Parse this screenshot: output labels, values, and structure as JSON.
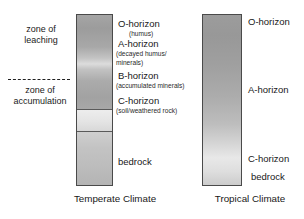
{
  "diagram": {
    "title_hidden": "Soil horizon profiles",
    "zones": [
      {
        "name": "zone-of-leaching",
        "line1": "zone of",
        "line2": "leaching"
      },
      {
        "name": "zone-of-accumulation",
        "line1": "zone of",
        "line2": "accumulation"
      }
    ],
    "temperate": {
      "caption": "Temperate Climate",
      "horizons": [
        {
          "key": "o",
          "label": "O-horizon",
          "sub": "(humus)"
        },
        {
          "key": "a",
          "label": "A-horizon",
          "sub": "(decayed humus/",
          "sub2": "minerals)"
        },
        {
          "key": "b",
          "label": "B-horizon",
          "sub": "(accumulated minerals)"
        },
        {
          "key": "c",
          "label": "C-horizon",
          "sub": "(soil/weathered rock)"
        },
        {
          "key": "bedrock",
          "label": "bedrock",
          "sub": ""
        }
      ]
    },
    "tropical": {
      "caption": "Tropical Climate",
      "horizons": [
        {
          "key": "o",
          "label": "O-horizon"
        },
        {
          "key": "a",
          "label": "A-horizon"
        },
        {
          "key": "c",
          "label": "C-horizon"
        },
        {
          "key": "bedrock",
          "label": "bedrock"
        }
      ]
    },
    "colors": {
      "ink": "#181818",
      "outline": "#4a4a4a",
      "soil_dark": "#9a9a9a",
      "soil_mid": "#bcbcbc",
      "soil_light": "#e6e6e6"
    }
  }
}
